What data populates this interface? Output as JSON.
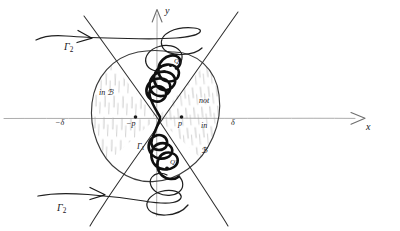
{
  "figure": {
    "kind": "hand-drawn-math-diagram",
    "ink_color": "#16161a",
    "axis_color": "#9a9a9a",
    "hatch_color": "#b7b7b7",
    "background": "#ffffff"
  },
  "axes": {
    "x_label": "x",
    "y_label": "y",
    "x_arrow": "arrow-right",
    "y_arrow": "arrow-up"
  },
  "ticks": {
    "left_delta": "−δ",
    "right_delta": "δ"
  },
  "points": [
    {
      "name": "minus-p",
      "label": "−p",
      "x": -1,
      "y": 0
    },
    {
      "name": "p",
      "label": "p",
      "x": 1,
      "y": 0
    },
    {
      "name": "Q",
      "label": "Q"
    },
    {
      "name": "Q-prime",
      "label": "Q′"
    }
  ],
  "regions": {
    "left": {
      "label": "in ℬ",
      "hatched": true
    },
    "right": {
      "label_line1": "not",
      "label_line2": "in",
      "label_line3": "ℬ",
      "hatched": true
    }
  },
  "curves": [
    {
      "name": "gamma-1",
      "label": "Γ",
      "subscript": "1"
    },
    {
      "name": "gamma-2-top",
      "label": "Γ",
      "subscript": "2",
      "arrow": "arrow-left"
    },
    {
      "name": "gamma-2-bottom",
      "label": "Γ",
      "subscript": "2",
      "arrow": "arrow-right"
    }
  ]
}
